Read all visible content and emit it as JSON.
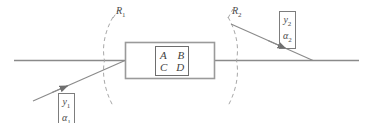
{
  "diagram": {
    "colors": {
      "axis": "#8a8a8a",
      "box_stroke": "#9a9a9a",
      "ray": "#8a8a8a",
      "dashed_arc": "#a8a8a8",
      "text": "#4a4a4a",
      "background": "#ffffff"
    },
    "system_box": {
      "matrix": {
        "row1": [
          "A",
          "B"
        ],
        "row2": [
          "C",
          "D"
        ]
      }
    },
    "reference_planes": [
      {
        "name": "R1",
        "label": "R",
        "subscript": "1"
      },
      {
        "name": "R2",
        "label": "R",
        "subscript": "2"
      }
    ],
    "input_ray": {
      "vector_rows": [
        {
          "symbol": "y",
          "subscript": "1"
        },
        {
          "symbol": "α",
          "subscript": "1"
        }
      ]
    },
    "output_ray": {
      "vector_rows": [
        {
          "symbol": "y",
          "subscript": "2"
        },
        {
          "symbol": "α",
          "subscript": "2"
        }
      ]
    }
  }
}
